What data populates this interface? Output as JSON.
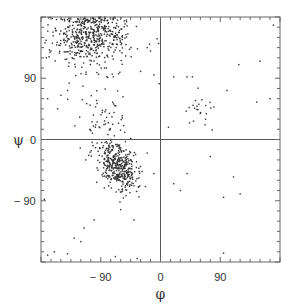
{
  "chart_data": {
    "type": "scatter",
    "title": "",
    "xlabel": "φ",
    "ylabel": "ψ",
    "xlim": [
      -180,
      180
    ],
    "ylim": [
      -180,
      180
    ],
    "xticks": [
      -90,
      0,
      90
    ],
    "yticks": [
      90,
      0,
      -90
    ],
    "xtick_labels": [
      "− 90",
      "0",
      "90"
    ],
    "ytick_labels": [
      "90",
      "0",
      "− 90"
    ],
    "minor_tick_step": 15,
    "grid": false,
    "zero_lines": true,
    "legend": null,
    "point_color": "#333333",
    "clusters": [
      {
        "name": "beta-sheet",
        "cx": -105,
        "cy": 150,
        "sx": 30,
        "sy": 22,
        "n": 520,
        "seed": 11
      },
      {
        "name": "alpha-helix",
        "cx": -63,
        "cy": -42,
        "sx": 12,
        "sy": 14,
        "n": 380,
        "seed": 23
      },
      {
        "name": "bridge",
        "cx": -85,
        "cy": 20,
        "sx": 18,
        "sy": 30,
        "n": 90,
        "seed": 37
      },
      {
        "name": "left-handed-helix",
        "cx": 60,
        "cy": 48,
        "sx": 10,
        "sy": 12,
        "n": 22,
        "seed": 41
      }
    ],
    "points": [
      [
        -170,
        -170
      ],
      [
        -160,
        -165
      ],
      [
        -140,
        -168
      ],
      [
        -120,
        -150
      ],
      [
        -115,
        -130
      ],
      [
        -130,
        -145
      ],
      [
        -175,
        -88
      ],
      [
        -100,
        -118
      ],
      [
        -60,
        -103
      ],
      [
        -40,
        -118
      ],
      [
        -35,
        -175
      ],
      [
        -68,
        -172
      ],
      [
        -170,
        60
      ],
      [
        -150,
        65
      ],
      [
        -140,
        72
      ],
      [
        -155,
        45
      ],
      [
        -165,
        130
      ],
      [
        -172,
        120
      ],
      [
        -20,
        135
      ],
      [
        -15,
        130
      ],
      [
        -5,
        148
      ],
      [
        -30,
        100
      ],
      [
        -10,
        95
      ],
      [
        20,
        92
      ],
      [
        40,
        92
      ],
      [
        48,
        92
      ],
      [
        100,
        72
      ],
      [
        150,
        115
      ],
      [
        170,
        168
      ],
      [
        145,
        55
      ],
      [
        165,
        60
      ],
      [
        12,
        18
      ],
      [
        78,
        14
      ],
      [
        118,
        110
      ],
      [
        -2,
        82
      ],
      [
        75,
        -25
      ],
      [
        110,
        -55
      ],
      [
        30,
        -75
      ],
      [
        20,
        -65
      ],
      [
        -10,
        -50
      ],
      [
        -20,
        -20
      ],
      [
        95,
        -85
      ],
      [
        120,
        -80
      ],
      [
        95,
        -167
      ],
      [
        40,
        -50
      ]
    ]
  }
}
